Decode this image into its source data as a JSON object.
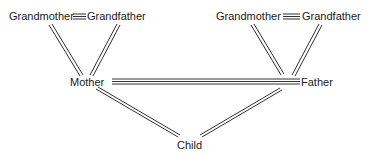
{
  "diagram": {
    "type": "family-tree",
    "colors": {
      "line": "#1a1a1a",
      "text": "#1a1a1a",
      "background": "#ffffff"
    },
    "nodes": {
      "maternal_grandmother": {
        "label": "Grandmother"
      },
      "maternal_grandfather": {
        "label": "Grandfather"
      },
      "paternal_grandmother": {
        "label": "Grandmother"
      },
      "paternal_grandfather": {
        "label": "Grandfather"
      },
      "mother": {
        "label": "Mother"
      },
      "father": {
        "label": "Father"
      },
      "child": {
        "label": "Child"
      }
    },
    "edges": [
      {
        "from": "maternal_grandmother",
        "to": "maternal_grandfather",
        "style": "triple-line",
        "kind": "marriage"
      },
      {
        "from": "paternal_grandmother",
        "to": "paternal_grandfather",
        "style": "triple-line",
        "kind": "marriage"
      },
      {
        "from": "mother",
        "to": "father",
        "style": "triple-line",
        "kind": "marriage"
      },
      {
        "from": "maternal_grandmother",
        "to": "mother",
        "style": "double-line",
        "kind": "descent"
      },
      {
        "from": "maternal_grandfather",
        "to": "mother",
        "style": "double-line",
        "kind": "descent"
      },
      {
        "from": "paternal_grandmother",
        "to": "father",
        "style": "double-line",
        "kind": "descent"
      },
      {
        "from": "paternal_grandfather",
        "to": "father",
        "style": "double-line",
        "kind": "descent"
      },
      {
        "from": "mother",
        "to": "child",
        "style": "double-line",
        "kind": "descent"
      },
      {
        "from": "father",
        "to": "child",
        "style": "double-line",
        "kind": "descent"
      }
    ]
  }
}
